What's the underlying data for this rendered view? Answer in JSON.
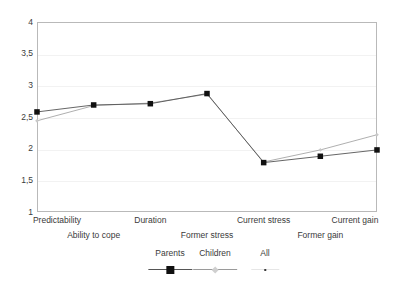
{
  "chart_data": {
    "type": "line",
    "title": "",
    "subtitle": "",
    "xlabel": "",
    "ylabel": "",
    "ylim": [
      1,
      4
    ],
    "ytick_labels": [
      "4",
      "3,5",
      "3",
      "2,5",
      "2",
      "1,5",
      "1"
    ],
    "ytick_values": [
      4,
      3.5,
      3,
      2.5,
      2,
      1.5,
      1
    ],
    "grid": "horizontal",
    "legend_position": "bottom",
    "categories": [
      "Predictability",
      "Ability to cope",
      "Duration",
      "Former stress",
      "Current stress",
      "Former gain",
      "Current gain"
    ],
    "series": [
      {
        "name": "Parents",
        "marker": "square",
        "color": "#101010",
        "values": [
          2.58,
          2.69,
          2.71,
          2.87,
          1.78,
          1.88,
          1.98
        ]
      },
      {
        "name": "Children",
        "marker": "small-diamond",
        "color": "#9a9a9a",
        "values": [
          2.44,
          2.68,
          2.72,
          2.86,
          1.79,
          1.98,
          2.22
        ]
      },
      {
        "name": "All",
        "marker": "dot",
        "color": "#e6e6e6",
        "values": [
          null,
          null,
          null,
          null,
          null,
          null,
          null
        ]
      }
    ]
  },
  "axes": {
    "y_ticks": [
      {
        "label": "4",
        "value": 4
      },
      {
        "label": "3,5",
        "value": 3.5
      },
      {
        "label": "3",
        "value": 3
      },
      {
        "label": "2,5",
        "value": 2.5
      },
      {
        "label": "2",
        "value": 2
      },
      {
        "label": "1,5",
        "value": 1.5
      },
      {
        "label": "1",
        "value": 1
      }
    ],
    "x_labels": [
      {
        "text": "Predictability",
        "row": 0
      },
      {
        "text": "Ability to cope",
        "row": 1
      },
      {
        "text": "Duration",
        "row": 0
      },
      {
        "text": "Former stress",
        "row": 1
      },
      {
        "text": "Current stress",
        "row": 0
      },
      {
        "text": "Former gain",
        "row": 1
      },
      {
        "text": "Current gain",
        "row": 0
      }
    ]
  },
  "legend": {
    "entries": [
      {
        "label": "Parents",
        "swatch": "square-marker-line"
      },
      {
        "label": "Children",
        "swatch": "light-line-marker"
      },
      {
        "label": "All",
        "swatch": "dot-marker"
      }
    ]
  },
  "colors": {
    "parents_line": "#555555",
    "parents_marker": "#101010",
    "children_line": "#9a9a9a",
    "all_line": "#e6e6e6",
    "plot_border": "#b9b9b9",
    "gridline": "#f2f2f2",
    "text": "#3a3a3a",
    "background": "#ffffff"
  },
  "scan": {
    "bottom_artifact": ""
  }
}
